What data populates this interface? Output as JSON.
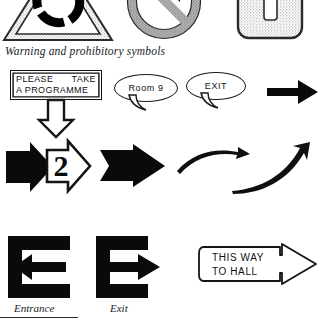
{
  "page": {
    "background": "#ffffff",
    "ink": "#111111"
  },
  "captions": {
    "warning_symbols": "Warning and prohibitory symbols"
  },
  "symbols_row": {
    "items": [
      {
        "name": "warning-triangle-symbol",
        "note": "triangle with segmented ring"
      },
      {
        "name": "prohibition-circle-symbol",
        "note": "circle with diagonal slash"
      },
      {
        "name": "rounded-plate-symbol",
        "note": "rounded square with vertical bar"
      }
    ]
  },
  "programme_sign": {
    "line1_left": "PLEASE",
    "line1_right": "TAKE",
    "line2": "A PROGRAMME"
  },
  "bubbles": [
    {
      "name": "speech-bubble-room",
      "text": "Room  9"
    },
    {
      "name": "speech-bubble-exit",
      "text": "EXIT"
    }
  ],
  "arrows": {
    "down_outline": "down-arrow-outline",
    "right_solid_1": "right-arrow-solid",
    "right_solid_2": "right-arrow-solid",
    "outline_numbered": {
      "name": "right-arrow-outline-numbered",
      "number": "2"
    },
    "right_notched": "right-arrow-notched-tail",
    "curve_flat": "curved-arrow-right",
    "curve_up": "curved-arrow-up-right"
  },
  "direction_signs": {
    "entrance_label": "Entrance",
    "exit_label": "Exit",
    "thisway": {
      "line1": "THIS   WAY",
      "line2": "TO  HALL"
    }
  }
}
